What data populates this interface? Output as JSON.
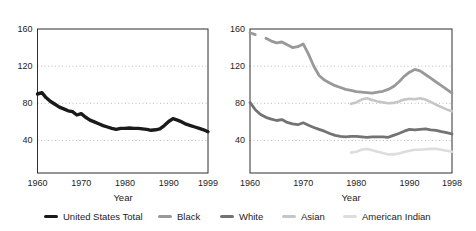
{
  "figure": {
    "background": "#ffffff",
    "text_color": "#1d1d1d",
    "axis_color": "#2f2f2f",
    "grid_color": "#b5b5b5"
  },
  "chart_data": [
    {
      "type": "line",
      "panel": "left",
      "title": "",
      "xlabel": "Year",
      "ylabel": "",
      "xlim": [
        1960,
        1999
      ],
      "ylim": [
        5,
        160
      ],
      "x_ticks": [
        1960,
        1970,
        1980,
        1990,
        1999
      ],
      "y_ticks": [
        40,
        80,
        120,
        160
      ],
      "grid": "horizontal dotted at y ticks",
      "legend_position": "below figure",
      "series": [
        {
          "name": "United States Total",
          "color": "#1a1a1a",
          "stroke_width": 3.4,
          "segments": [
            {
              "start_year": 1960,
              "values": [
                90,
                91.5,
                86,
                82,
                79,
                76,
                74,
                72,
                71,
                67.5,
                69,
                65,
                62,
                60,
                58,
                56,
                54.5,
                53,
                52,
                53,
                53,
                53.5,
                53,
                53,
                52.5,
                52,
                51,
                51.5,
                52.5,
                56,
                60.5,
                63.5,
                62,
                60,
                57.5,
                56,
                54.5,
                53,
                51.5,
                49.5
              ]
            }
          ]
        }
      ]
    },
    {
      "type": "line",
      "panel": "right",
      "title": "",
      "xlabel": "Year",
      "ylabel": "",
      "xlim": [
        1960,
        1998
      ],
      "ylim": [
        5,
        160
      ],
      "x_ticks": [
        1960,
        1970,
        1980,
        1990,
        1998
      ],
      "y_ticks": [
        40,
        80,
        120,
        160
      ],
      "grid": "horizontal dotted at y ticks",
      "legend_position": "below figure",
      "series": [
        {
          "name": "Black",
          "color": "#999999",
          "stroke_width": 2.8,
          "segments": [
            {
              "start_year": 1960,
              "values": [
                156,
                154
              ]
            },
            {
              "start_year": 1963,
              "values": [
                150,
                147,
                145,
                146,
                143,
                140,
                141,
                144,
                133,
                120,
                110,
                105,
                102,
                99,
                97,
                95,
                94,
                92.5,
                92,
                91.5,
                91,
                92,
                93,
                95,
                98,
                103,
                109,
                113.5,
                116.5,
                115,
                111,
                107,
                103,
                99,
                95,
                91
              ]
            }
          ]
        },
        {
          "name": "White",
          "color": "#737373",
          "stroke_width": 2.8,
          "segments": [
            {
              "start_year": 1960,
              "values": [
                81,
                73,
                68,
                65,
                63,
                61.5,
                62.5,
                59.5,
                58,
                57,
                59,
                56.5,
                54,
                52,
                50,
                47.5,
                45.5,
                44.5,
                44,
                44.5,
                44.5,
                44,
                43.5,
                44,
                44,
                44,
                43.5,
                45.5,
                47.5,
                50,
                52,
                51.5,
                52,
                52.5,
                51.5,
                51,
                49.5,
                48.5,
                47
              ]
            }
          ]
        },
        {
          "name": "Asian",
          "color": "#c6c6c6",
          "stroke_width": 2.6,
          "segments": [
            {
              "start_year": 1979,
              "values": [
                79.5,
                81,
                84,
                85.5,
                83.5,
                82,
                81,
                80,
                80.5,
                82,
                84,
                85,
                84.5,
                85.5,
                84,
                81.5,
                78.5,
                76,
                73.5,
                71.5
              ]
            }
          ]
        },
        {
          "name": "American Indian",
          "color": "#dddddd",
          "stroke_width": 2.6,
          "segments": [
            {
              "start_year": 1979,
              "values": [
                27,
                28,
                30,
                31,
                29.5,
                28,
                26.5,
                25,
                25,
                26,
                27.5,
                29,
                30,
                30,
                30.5,
                31,
                31,
                30,
                29,
                28
              ]
            }
          ]
        }
      ]
    }
  ],
  "legend": {
    "items": [
      {
        "label": "United States Total",
        "color": "#1a1a1a",
        "thick": true
      },
      {
        "label": "Black",
        "color": "#999999",
        "thick": false
      },
      {
        "label": "White",
        "color": "#737373",
        "thick": false
      },
      {
        "label": "Asian",
        "color": "#c6c6c6",
        "thick": false
      },
      {
        "label": "American Indian",
        "color": "#dddddd",
        "thick": false
      }
    ]
  }
}
